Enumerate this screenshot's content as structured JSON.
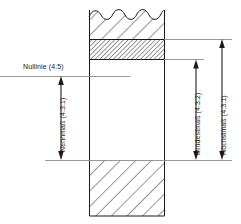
{
  "drawing": {
    "title": "Toleranzbegriffe - Nullinie, Nennmass, Mindestmass, Hoechstmass",
    "type": "technical-section-drawing",
    "background_color": "#ffffff",
    "line_color": "#1a1a1a",
    "thin_line_color": "#8c8c8c",
    "hatch_color": "#2b2b2b"
  },
  "labels": {
    "zero_line": "Nullinie (4.5)",
    "nominal_size": "Nennmaß (4.3.1)",
    "minimum_size": "Mindestmaß (4.3.2)",
    "maximum_size": "Höchstmaß (4.3.1)"
  },
  "geometry": {
    "body_left": 89,
    "body_right": 165,
    "body_top": 8,
    "body_bottom": 216,
    "tolerance_zone_top": 39,
    "tolerance_zone_bottom": 60,
    "datum_line_y": 160,
    "zero_line_y": 76
  },
  "dimensions": [
    {
      "name": "nominal-size",
      "label": "Nennmaß (4.3.1)",
      "reference": "4.3.1",
      "axis_x": 61,
      "from_y": 76,
      "to_y": 160,
      "orientation": "vertical"
    },
    {
      "name": "minimum-size",
      "label": "Mindestmaß (4.3.2)",
      "reference": "4.3.2",
      "axis_x": 196,
      "from_y": 60,
      "to_y": 160,
      "orientation": "vertical"
    },
    {
      "name": "maximum-size",
      "label": "Höchstmaß (4.3.1)",
      "reference": "4.3.1",
      "axis_x": 222,
      "from_y": 39,
      "to_y": 160,
      "orientation": "vertical"
    }
  ]
}
